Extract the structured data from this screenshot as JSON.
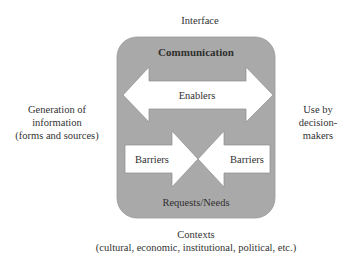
{
  "diagram": {
    "top_label": "Interface",
    "left_label": [
      "Generation of",
      "information",
      "(forms and sources)"
    ],
    "right_label": [
      "Use by",
      "decision-",
      "makers"
    ],
    "bottom_label": [
      "Contexts",
      "(cultural, economic, institutional, political, etc.)"
    ],
    "box": {
      "top_text": "Communication",
      "bottom_text": "Requests/Needs",
      "fill": "#a9a9a9"
    },
    "enablers_arrow": {
      "label": "Enablers",
      "direction": "bidirectional",
      "fill": "#ffffff"
    },
    "barriers_left_arrow": {
      "label": "Barriers",
      "direction": "right",
      "fill": "#ffffff"
    },
    "barriers_right_arrow": {
      "label": "Barriers",
      "direction": "left",
      "fill": "#ffffff"
    }
  }
}
